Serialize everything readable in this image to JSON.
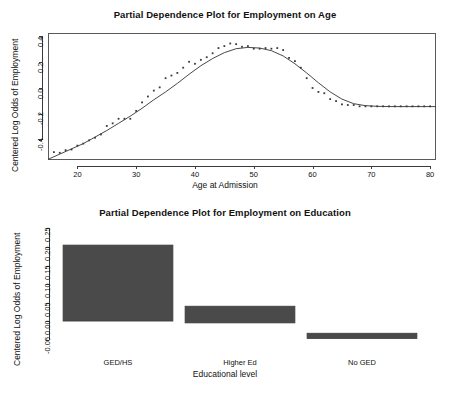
{
  "figure": {
    "background": "#ffffff",
    "ink": "#333333",
    "bar_fill": "#4a4a4a",
    "bar_stroke": "#3c3c3c"
  },
  "chart_data": [
    {
      "type": "scatter",
      "id": "employment-on-age",
      "title": "Partial Dependence Plot for Employment on Age",
      "xlabel": "Age at Admission",
      "ylabel": "Centered Log Odds of Employment",
      "xlim": [
        15,
        81
      ],
      "ylim": [
        -0.55,
        0.42
      ],
      "xticks": [
        20,
        30,
        40,
        50,
        60,
        70,
        80
      ],
      "xtick_labels": [
        "20",
        "30",
        "40",
        "50",
        "60",
        "70",
        "80"
      ],
      "yticks": [
        -0.4,
        -0.2,
        0.0,
        0.2,
        0.4
      ],
      "ytick_labels": [
        "-0.4",
        "-0.2",
        "0.0",
        "0.2",
        "0.4"
      ],
      "grid": false,
      "legend": null,
      "series": [
        {
          "name": "partial dependence points",
          "marker": "point",
          "x": [
            16,
            17,
            18,
            19,
            20,
            21,
            22,
            23,
            24,
            25,
            26,
            27,
            28,
            29,
            30,
            31,
            32,
            33,
            34,
            35,
            36,
            37,
            38,
            39,
            40,
            41,
            42,
            43,
            44,
            45,
            46,
            47,
            48,
            49,
            50,
            51,
            52,
            53,
            54,
            55,
            56,
            57,
            58,
            59,
            60,
            61,
            62,
            63,
            64,
            65,
            66,
            67,
            68,
            69,
            70,
            71,
            72,
            73,
            74,
            75,
            76,
            77,
            78,
            79,
            80
          ],
          "y": [
            -0.49,
            -0.495,
            -0.475,
            -0.47,
            -0.44,
            -0.425,
            -0.4,
            -0.38,
            -0.355,
            -0.29,
            -0.27,
            -0.235,
            -0.235,
            -0.235,
            -0.175,
            -0.11,
            -0.065,
            -0.02,
            0.005,
            0.075,
            0.095,
            0.115,
            0.155,
            0.2,
            0.185,
            0.215,
            0.235,
            0.265,
            0.305,
            0.32,
            0.34,
            0.335,
            0.315,
            0.32,
            0.3,
            0.3,
            0.305,
            0.3,
            0.305,
            0.29,
            0.23,
            0.205,
            0.155,
            0.075,
            0.0,
            -0.03,
            -0.04,
            -0.085,
            -0.1,
            -0.125,
            -0.13,
            -0.13,
            -0.14,
            -0.14,
            -0.14,
            -0.14,
            -0.14,
            -0.14,
            -0.14,
            -0.14,
            -0.14,
            -0.14,
            -0.14,
            -0.14,
            -0.14
          ]
        },
        {
          "name": "smoothed fit",
          "marker": "line",
          "x": [
            15,
            17,
            19,
            21,
            23,
            25,
            27,
            29,
            31,
            33,
            35,
            37,
            39,
            41,
            43,
            45,
            47,
            49,
            51,
            53,
            55,
            57,
            59,
            61,
            63,
            65,
            67,
            69,
            71,
            73,
            75,
            77,
            79,
            81
          ],
          "y": [
            -0.545,
            -0.505,
            -0.465,
            -0.425,
            -0.375,
            -0.325,
            -0.27,
            -0.215,
            -0.155,
            -0.09,
            -0.03,
            0.035,
            0.105,
            0.17,
            0.225,
            0.27,
            0.3,
            0.31,
            0.305,
            0.285,
            0.245,
            0.185,
            0.115,
            0.04,
            -0.03,
            -0.085,
            -0.12,
            -0.135,
            -0.14,
            -0.142,
            -0.142,
            -0.142,
            -0.142,
            -0.142
          ]
        }
      ]
    },
    {
      "type": "bar",
      "id": "employment-on-education",
      "title": "Partial Dependence Plot for Employment on Education",
      "xlabel": "Educational level",
      "ylabel": "Centered Log Odds of Employment",
      "categories": [
        "GED/HS",
        "Higher Ed",
        "No GED"
      ],
      "values": [
        0.205,
        0.04,
        -0.033
      ],
      "baselines": [
        0.0,
        -0.005,
        -0.047
      ],
      "ylim": [
        -0.062,
        0.262
      ],
      "yticks": [
        -0.05,
        0.0,
        0.05,
        0.1,
        0.15,
        0.2,
        0.25
      ],
      "ytick_labels": [
        "-0.05",
        "0.00",
        "0.05",
        "0.10",
        "0.15",
        "0.20",
        "0.25"
      ],
      "grid": false,
      "legend": null
    }
  ]
}
